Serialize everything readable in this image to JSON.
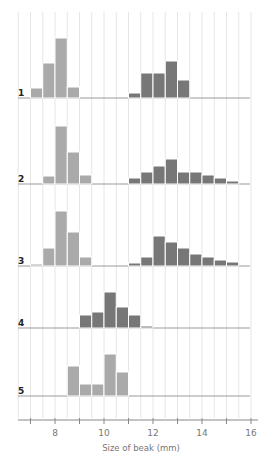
{
  "chart_data": {
    "type": "bar",
    "subtype": "stacked-panel histograms",
    "title": "",
    "xlabel": "Size of beak (mm)",
    "ylabel": "",
    "xlim": [
      6.5,
      16
    ],
    "x_ticks": [
      7,
      8,
      9,
      10,
      11,
      12,
      13,
      14,
      15,
      16
    ],
    "x_tick_labels": [
      "",
      "8",
      "",
      "10",
      "",
      "12",
      "",
      "14",
      "",
      "16"
    ],
    "bin_width": 0.5,
    "grid": "vertical lines every 0.5 mm",
    "series_colors": {
      "light": "#aaaaaa",
      "dark": "#777777"
    },
    "panels": [
      {
        "label": "1",
        "light": {
          "bins": [
            7.0,
            7.5,
            8.0,
            8.5
          ],
          "values": [
            10,
            35,
            60,
            11
          ]
        },
        "dark": {
          "bins": [
            11.0,
            11.5,
            12.0,
            12.5,
            13.0
          ],
          "values": [
            5,
            25,
            25,
            37,
            18
          ]
        }
      },
      {
        "label": "2",
        "light": {
          "bins": [
            7.5,
            8.0,
            8.5,
            9.0
          ],
          "values": [
            8,
            58,
            32,
            9
          ]
        },
        "dark": {
          "bins": [
            11.0,
            11.5,
            12.0,
            12.5,
            13.0,
            13.5,
            14.0,
            14.5,
            15.0
          ],
          "values": [
            6,
            12,
            18,
            25,
            12,
            12,
            9,
            6,
            3
          ]
        }
      },
      {
        "label": "3",
        "light": {
          "bins": [
            7.0,
            7.5,
            8.0,
            8.5,
            9.0
          ],
          "values": [
            2,
            18,
            55,
            34,
            9
          ]
        },
        "dark": {
          "bins": [
            11.0,
            11.5,
            12.0,
            12.5,
            13.0,
            13.5,
            14.0,
            14.5,
            15.0
          ],
          "values": [
            3,
            9,
            30,
            24,
            18,
            12,
            9,
            6,
            4
          ]
        }
      },
      {
        "label": "4",
        "dark": {
          "bins": [
            9.0,
            9.5,
            10.0,
            10.5,
            11.0,
            11.5
          ],
          "values": [
            13,
            16,
            36,
            21,
            13,
            2
          ]
        }
      },
      {
        "label": "5",
        "light": {
          "bins": [
            8.5,
            9.0,
            9.5,
            10.0,
            10.5
          ],
          "values": [
            30,
            12,
            12,
            42,
            24
          ]
        }
      }
    ]
  }
}
